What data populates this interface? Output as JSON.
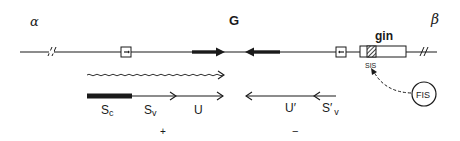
{
  "diagram": {
    "title_region_label": "G",
    "left_end_label": "α",
    "right_end_label": "β",
    "gene_label": "gin",
    "site_label": "SIS",
    "protein_label": "FIS",
    "transcripts": {
      "plus": {
        "segments": [
          "Sc",
          "Sv",
          "U"
        ],
        "sc_main": "S",
        "sc_sub": "c",
        "sv_main": "S",
        "sv_sub": "v",
        "u": "U",
        "strand": "+"
      },
      "minus": {
        "u_prime": "U′",
        "sv_prime_main": "S′",
        "sv_prime_sub": "v",
        "strand": "−"
      }
    },
    "colors": {
      "ink": "#1a1a1a",
      "background": "#ffffff"
    }
  }
}
